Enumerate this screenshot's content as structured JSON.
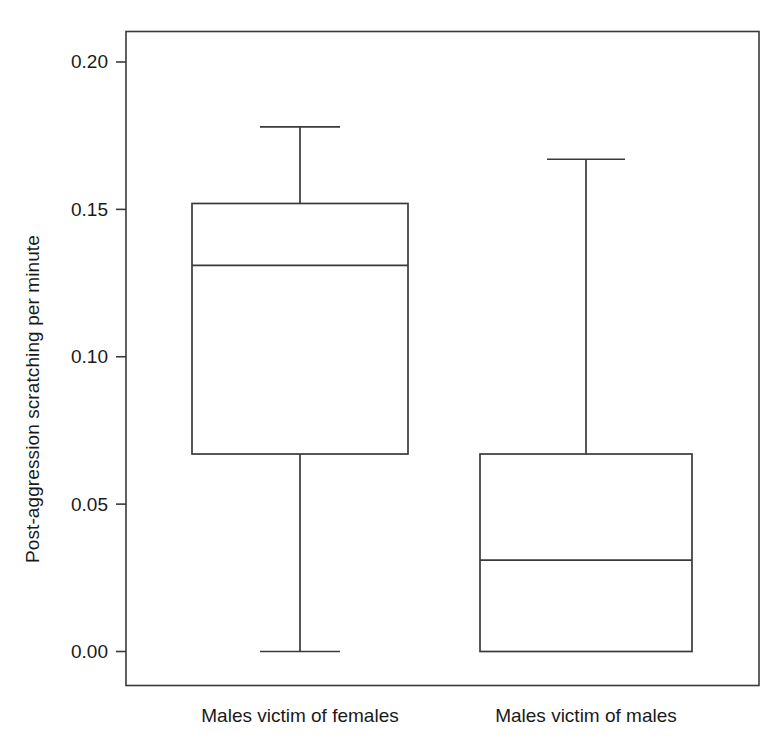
{
  "chart_data": {
    "type": "box",
    "title": "",
    "xlabel": "",
    "ylabel": "Post-aggression scratching per minute",
    "ylim": [
      -0.006,
      0.2135
    ],
    "yticks": [
      0.0,
      0.05,
      0.1,
      0.15,
      0.2
    ],
    "ytick_labels": [
      "0.00",
      "0.05",
      "0.10",
      "0.15",
      "0.20"
    ],
    "grid": false,
    "legend": "none",
    "categories": [
      "Males victim of females",
      "Males victim of males"
    ],
    "boxes": [
      {
        "category": "Males victim of females",
        "whisker_low": 0.0,
        "q1": 0.067,
        "median": 0.131,
        "q3": 0.152,
        "whisker_high": 0.178,
        "outliers": []
      },
      {
        "category": "Males victim of males",
        "whisker_low": 0.0,
        "q1": 0.0,
        "median": 0.031,
        "q3": 0.067,
        "whisker_high": 0.167,
        "outliers": []
      }
    ],
    "colors": {
      "line": "#3a3a3a",
      "fill": "#ffffff",
      "background": "#ffffff",
      "text": "#1a1a1a"
    }
  },
  "axis": {
    "y_title": "Post-aggression scratching per minute",
    "tick_0": "0.00",
    "tick_1": "0.05",
    "tick_2": "0.10",
    "tick_3": "0.15",
    "tick_4": "0.20"
  },
  "categories": {
    "cat_0": "Males victim of females",
    "cat_1": "Males victim of males"
  }
}
